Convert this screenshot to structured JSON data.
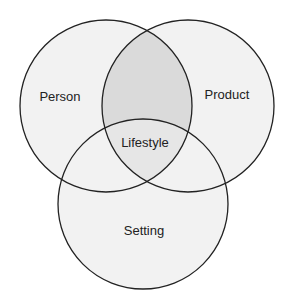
{
  "diagram": {
    "type": "venn",
    "background": "#ffffff",
    "stroke_color": "#222222",
    "stroke_width": 1.3,
    "sets": [
      {
        "id": "person",
        "label": "Person",
        "cx": 106,
        "cy": 106,
        "r": 86,
        "fill": "#f2f2f2",
        "label_x": 60,
        "label_y": 101
      },
      {
        "id": "product",
        "label": "Product",
        "cx": 188,
        "cy": 106,
        "r": 86,
        "fill": "#f2f2f2",
        "label_x": 227,
        "label_y": 99
      },
      {
        "id": "setting",
        "label": "Setting",
        "cx": 143,
        "cy": 204,
        "r": 85,
        "fill": "#f2f2f2",
        "label_x": 144,
        "label_y": 235
      }
    ],
    "intersections": [
      {
        "id": "person-product",
        "sets": [
          "person",
          "product"
        ],
        "fill": "#dadada"
      },
      {
        "id": "person-product-setting",
        "sets": [
          "person",
          "product",
          "setting"
        ],
        "fill": "#e6e6e6",
        "label": "Lifestyle",
        "label_x": 145,
        "label_y": 147
      }
    ]
  }
}
